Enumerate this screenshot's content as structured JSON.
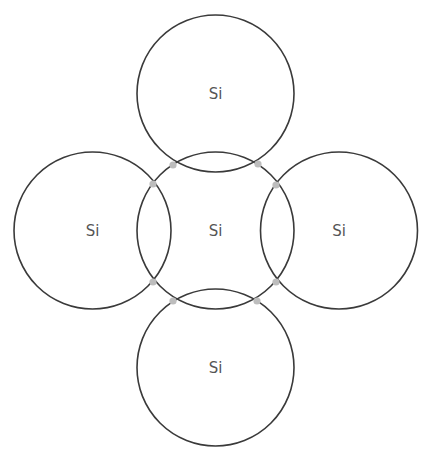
{
  "diagram": {
    "colors": {
      "circle_stroke": "#3a3a3a",
      "label": "#555555",
      "electron_dot": "#bdbdbd",
      "background": "#ffffff"
    },
    "atoms": [
      {
        "id": "top",
        "label": "Si",
        "cx": 215.5,
        "cy": 93.5,
        "r": 78.5
      },
      {
        "id": "left",
        "label": "Si",
        "cx": 92.5,
        "cy": 230.5,
        "r": 78.5
      },
      {
        "id": "center",
        "label": "Si",
        "cx": 215.5,
        "cy": 230.5,
        "r": 78.5
      },
      {
        "id": "right",
        "label": "Si",
        "cx": 339,
        "cy": 230.5,
        "r": 78.5
      },
      {
        "id": "bottom",
        "label": "Si",
        "cx": 215.5,
        "cy": 367.5,
        "r": 78.5
      }
    ],
    "electrons": [
      {
        "x": 173,
        "y": 165
      },
      {
        "x": 258,
        "y": 164
      },
      {
        "x": 153,
        "y": 184
      },
      {
        "x": 276,
        "y": 185
      },
      {
        "x": 153,
        "y": 282
      },
      {
        "x": 276,
        "y": 282
      },
      {
        "x": 173,
        "y": 301
      },
      {
        "x": 257,
        "y": 301
      }
    ]
  }
}
